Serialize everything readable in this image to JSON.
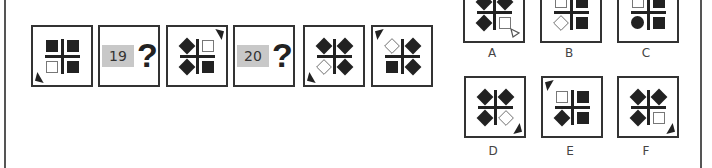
{
  "sequence": [
    {
      "type": "figure",
      "id": "seq-1",
      "pointer": "bottom-left",
      "tl": "sq-fill",
      "tr": "sq-fill",
      "bl": "sq-open",
      "br": "sq-fill"
    },
    {
      "type": "question",
      "id": "q19",
      "number": "19",
      "mark": "?"
    },
    {
      "type": "figure",
      "id": "seq-3",
      "pointer": "top-right",
      "tl": "dia-fill",
      "tr": "sq-open",
      "bl": "dia-fill",
      "br": "sq-fill"
    },
    {
      "type": "question",
      "id": "q20",
      "number": "20",
      "mark": "?"
    },
    {
      "type": "figure",
      "id": "seq-5",
      "pointer": "bottom-left",
      "tl": "dia-fill",
      "tr": "dia-fill",
      "bl": "dia-open",
      "br": "dia-fill"
    },
    {
      "type": "figure",
      "id": "seq-6",
      "pointer": "top-left",
      "tl": "dia-open",
      "tr": "dia-fill",
      "bl": "sq-fill",
      "br": "dia-fill"
    }
  ],
  "options": [
    {
      "label": "A",
      "pointer": "bottom-right-open",
      "tl": "dia-fill",
      "tr": "dia-fill",
      "bl": "dia-fill",
      "br": "sq-open"
    },
    {
      "label": "B",
      "pointer": "none",
      "tl": "sq-open",
      "tr": "sq-fill",
      "bl": "dia-open",
      "br": "sq-fill"
    },
    {
      "label": "C",
      "pointer": "none",
      "tl": "sq-open",
      "tr": "sq-fill",
      "bl": "circ-fill",
      "br": "sq-fill"
    },
    {
      "label": "D",
      "pointer": "bottom-right",
      "tl": "dia-fill",
      "tr": "dia-fill",
      "bl": "dia-fill",
      "br": "dia-open"
    },
    {
      "label": "E",
      "pointer": "top-left",
      "tl": "sq-open",
      "tr": "sq-fill",
      "bl": "dia-fill",
      "br": "sq-fill"
    },
    {
      "label": "F",
      "pointer": "bottom-right",
      "tl": "dia-fill",
      "tr": "dia-fill",
      "bl": "dia-fill",
      "br": "sq-open"
    }
  ]
}
